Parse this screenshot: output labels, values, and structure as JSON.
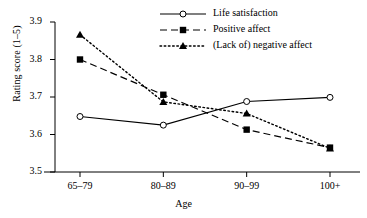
{
  "chart_data": {
    "type": "line",
    "title": "",
    "xlabel": "Age",
    "ylabel": "Rating score (1–5)",
    "categories": [
      "65–79",
      "80–89",
      "90–99",
      "100+"
    ],
    "ylim": [
      3.5,
      3.9
    ],
    "yticks": [
      "3.5",
      "3.6",
      "3.7",
      "3.8",
      "3.9"
    ],
    "ytick_values": [
      3.5,
      3.6,
      3.7,
      3.8,
      3.9
    ],
    "grid": false,
    "legend_position": "top-right",
    "series": [
      {
        "name": "Life satisfaction",
        "values": [
          3.648,
          3.625,
          3.688,
          3.699
        ],
        "marker": "open-circle",
        "line_style": "solid",
        "color": "#000000"
      },
      {
        "name": "Positive affect",
        "values": [
          3.8,
          3.706,
          3.613,
          3.565
        ],
        "marker": "filled-square",
        "line_style": "dashed",
        "color": "#000000"
      },
      {
        "name": "(Lack of) negative affect",
        "values": [
          3.866,
          3.687,
          3.656,
          3.563
        ],
        "marker": "filled-triangle",
        "line_style": "dotted",
        "color": "#000000"
      }
    ]
  },
  "axes": {
    "y_axis_name": "y-axis",
    "x_axis_name": "x-axis"
  }
}
